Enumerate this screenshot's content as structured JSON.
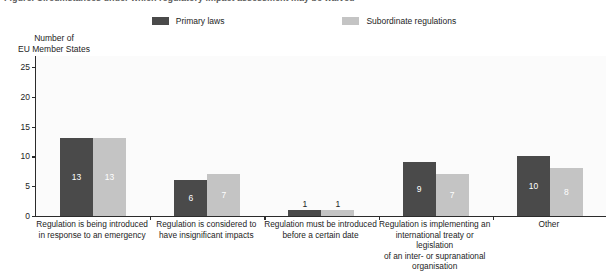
{
  "title_strip": {
    "clipped_text": "Figure. Circumstances under which regulatory impact assessment may be waived"
  },
  "legend": {
    "entries": [
      {
        "label": "Primary laws",
        "color": "#4a4a4a",
        "swatch_name": "legend-swatch-primary-laws"
      },
      {
        "label": "Subordinate regulations",
        "color": "#c4c4c4",
        "swatch_name": "legend-swatch-subordinate-regulations"
      }
    ]
  },
  "axis_title": {
    "line1": "Number of",
    "line2": "EU Member States"
  },
  "chart_data": {
    "type": "bar",
    "title": "",
    "xlabel": "",
    "ylabel": "Number of EU Member States",
    "ylim": [
      0,
      27
    ],
    "yticks": [
      0,
      5,
      10,
      15,
      20,
      25
    ],
    "ytick_labels": [
      "0",
      "5",
      "10",
      "15",
      "20",
      "25"
    ],
    "grid": false,
    "legend_position": "top-center",
    "categories": [
      "Regulation is being introduced in response to an emergency",
      "Regulation is considered to have insignificant impacts",
      "Regulation must be introduced before a certain date",
      "Regulation is implementing an international treaty or legislation of an inter- or supranational organisation",
      "Other"
    ],
    "category_lines": [
      [
        "Regulation is being introduced",
        "in response to an emergency"
      ],
      [
        "Regulation is considered to",
        "have insignificant impacts"
      ],
      [
        "Regulation must be introduced",
        "before a certain date"
      ],
      [
        "Regulation is implementing an",
        "international treaty or legislation",
        "of an inter- or supranational",
        "organisation"
      ],
      [
        "Other"
      ]
    ],
    "series": [
      {
        "name": "Primary laws",
        "color": "#4a4a4a",
        "values": [
          13,
          6,
          1,
          9,
          10
        ]
      },
      {
        "name": "Subordinate regulations",
        "color": "#c4c4c4",
        "values": [
          13,
          7,
          1,
          7,
          8
        ]
      }
    ]
  }
}
